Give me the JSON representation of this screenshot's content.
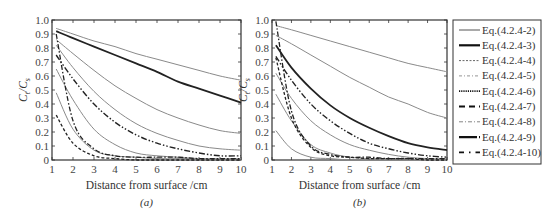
{
  "chart_data": [
    {
      "type": "line",
      "panel": "a",
      "caption": "(a)",
      "xlabel": "Distance from surface /cm",
      "ylabel_main": "C",
      "ylabel_sub1": "t",
      "ylabel_mid": "/C",
      "ylabel_sub2": "s",
      "xlim": [
        1,
        10
      ],
      "ylim": [
        0,
        1.0
      ],
      "xticks": [
        "1",
        "2",
        "3",
        "4",
        "5",
        "6",
        "7",
        "8",
        "9",
        "10"
      ],
      "yticks": [
        "0",
        "0.1",
        "0.2",
        "0.3",
        "0.4",
        "0.5",
        "0.6",
        "0.7",
        "0.8",
        "0.9",
        "1.0"
      ],
      "x": [
        1.2,
        2,
        3,
        4,
        5,
        6,
        7,
        8,
        9,
        10
      ],
      "series": [
        {
          "name": "Eq.(4.2.4-2)",
          "values": [
            0.94,
            0.9,
            0.85,
            0.81,
            0.76,
            0.72,
            0.68,
            0.64,
            0.6,
            0.57
          ]
        },
        {
          "name": "Eq.(4.2.4-3)",
          "values": [
            0.92,
            0.87,
            0.81,
            0.75,
            0.69,
            0.63,
            0.56,
            0.51,
            0.46,
            0.41
          ]
        },
        {
          "name": "Eq.(4.2.4-4)",
          "values": [
            0.86,
            0.76,
            0.64,
            0.53,
            0.44,
            0.36,
            0.3,
            0.25,
            0.21,
            0.19
          ]
        },
        {
          "name": "Eq.(4.2.4-5)",
          "values": [
            0.82,
            0.66,
            0.49,
            0.36,
            0.26,
            0.19,
            0.14,
            0.1,
            0.08,
            0.07
          ]
        },
        {
          "name": "Eq.(4.2.4-6)",
          "values": [
            0.75,
            0.58,
            0.4,
            0.27,
            0.18,
            0.12,
            0.08,
            0.05,
            0.03,
            0.03
          ]
        },
        {
          "name": "Eq.(4.2.4-7)",
          "values": [
            0.65,
            0.43,
            0.22,
            0.11,
            0.05,
            0.03,
            0.02,
            0.01,
            0.01,
            0.01
          ]
        },
        {
          "name": "Eq.(4.2.4-8)",
          "values": [
            0.48,
            0.22,
            0.07,
            0.03,
            0.02,
            0.01,
            0.01,
            0.01,
            0.0,
            0.0
          ]
        },
        {
          "name": "Eq.(4.2.4-9)",
          "values": [
            0.9,
            0.28,
            0.08,
            0.03,
            0.02,
            0.02,
            0.02,
            0.01,
            0.01,
            0.01
          ]
        },
        {
          "name": "Eq.(4.2.4-10)",
          "values": [
            0.32,
            0.12,
            0.03,
            0.01,
            0.0,
            0.0,
            0.0,
            0.0,
            0.0,
            0.0
          ]
        }
      ]
    },
    {
      "type": "line",
      "panel": "b",
      "caption": "(b)",
      "xlabel": "Distance from surface /cm",
      "ylabel_main": "C",
      "ylabel_sub1": "t",
      "ylabel_mid": "/C",
      "ylabel_sub2": "s",
      "xlim": [
        1,
        10
      ],
      "ylim": [
        0,
        1.0
      ],
      "xticks": [
        "1",
        "2",
        "3",
        "4",
        "5",
        "6",
        "7",
        "8",
        "9",
        "10"
      ],
      "yticks": [
        "0",
        "0.1",
        "0.2",
        "0.3",
        "0.4",
        "0.5",
        "0.6",
        "0.7",
        "0.8",
        "0.9",
        "1.0"
      ],
      "x": [
        1.2,
        2,
        3,
        4,
        5,
        6,
        7,
        8,
        9,
        10
      ],
      "series": [
        {
          "name": "Eq.(4.2.4-2)",
          "values": [
            0.96,
            0.93,
            0.89,
            0.85,
            0.81,
            0.77,
            0.73,
            0.69,
            0.66,
            0.63
          ]
        },
        {
          "name": "Eq.(4.2.4-3)",
          "values": [
            0.82,
            0.66,
            0.51,
            0.39,
            0.3,
            0.23,
            0.17,
            0.12,
            0.09,
            0.07
          ]
        },
        {
          "name": "Eq.(4.2.4-4)",
          "values": [
            0.89,
            0.83,
            0.75,
            0.67,
            0.59,
            0.52,
            0.45,
            0.4,
            0.34,
            0.3
          ]
        },
        {
          "name": "Eq.(4.2.4-5)",
          "values": [
            0.62,
            0.44,
            0.28,
            0.18,
            0.11,
            0.07,
            0.04,
            0.02,
            0.01,
            0.01
          ]
        },
        {
          "name": "Eq.(4.2.4-6)",
          "values": [
            0.74,
            0.57,
            0.4,
            0.28,
            0.19,
            0.12,
            0.08,
            0.05,
            0.03,
            0.02
          ]
        },
        {
          "name": "Eq.(4.2.4-7)",
          "values": [
            0.47,
            0.28,
            0.11,
            0.05,
            0.02,
            0.01,
            0.01,
            0.0,
            0.0,
            0.0
          ]
        },
        {
          "name": "Eq.(4.2.4-8)",
          "values": [
            0.21,
            0.08,
            0.02,
            0.01,
            0.0,
            0.0,
            0.0,
            0.0,
            0.0,
            0.0
          ]
        },
        {
          "name": "Eq.(4.2.4-9)",
          "values": [
            0.99,
            0.35,
            0.1,
            0.04,
            0.02,
            0.02,
            0.01,
            0.01,
            0.01,
            0.01
          ]
        },
        {
          "name": "Eq.(4.2.4-10)",
          "values": [
            0.73,
            0.3,
            0.09,
            0.03,
            0.02,
            0.01,
            0.01,
            0.01,
            0.0,
            0.0
          ]
        }
      ]
    }
  ],
  "legend": {
    "placement": "right",
    "entries": [
      {
        "label": "Eq.(4.2.4-2)",
        "style": "thin-gray"
      },
      {
        "label": "Eq.(4.2.4-3)",
        "style": "thick-black"
      },
      {
        "label": "Eq.(4.2.4-4)",
        "style": "dashed-fine"
      },
      {
        "label": "Eq.(4.2.4-5)",
        "style": "dash-dot-gray"
      },
      {
        "label": "Eq.(4.2.4-6)",
        "style": "dotted-bold"
      },
      {
        "label": "Eq.(4.2.4-7)",
        "style": "long-dash"
      },
      {
        "label": "Eq.(4.2.4-8)",
        "style": "dash-dot-light"
      },
      {
        "label": "Eq.(4.2.4-9)",
        "style": "thick-solid-dots"
      },
      {
        "label": "Eq.(4.2.4-10)",
        "style": "dash-dot-bold"
      }
    ]
  },
  "colors": {
    "axis": "#333333",
    "gray_line": "#8a8a8a",
    "dark_line": "#222222"
  }
}
